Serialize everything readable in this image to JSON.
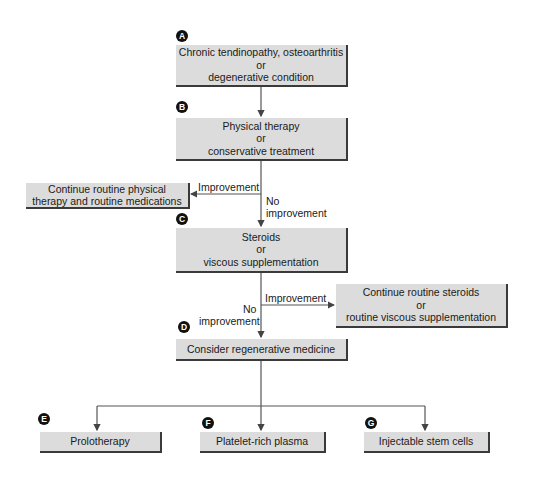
{
  "diagram": {
    "type": "flowchart",
    "nodes": [
      {
        "id": "A",
        "badge": "A",
        "lines": [
          "Chronic tendinopathy, osteoarthritis",
          "or",
          "degenerative condition"
        ]
      },
      {
        "id": "B",
        "badge": "B",
        "lines": [
          "Physical therapy",
          "or",
          "conservative treatment"
        ]
      },
      {
        "id": "B_alt",
        "lines": [
          "Continue routine physical",
          "therapy and routine medications"
        ]
      },
      {
        "id": "C",
        "badge": "C",
        "lines": [
          "Steroids",
          "or",
          "viscous supplementation"
        ]
      },
      {
        "id": "C_alt",
        "lines": [
          "Continue routine steroids",
          "or",
          "routine viscous supplementation"
        ]
      },
      {
        "id": "D",
        "badge": "D",
        "lines": [
          "Consider regenerative medicine"
        ]
      },
      {
        "id": "E",
        "badge": "E",
        "lines": [
          "Prolotherapy"
        ]
      },
      {
        "id": "F",
        "badge": "F",
        "lines": [
          "Platelet-rich plasma"
        ]
      },
      {
        "id": "G",
        "badge": "G",
        "lines": [
          "Injectable stem cells"
        ]
      }
    ],
    "edge_labels": {
      "b_improvement": "Improvement",
      "b_no_improvement": [
        "No",
        "improvement"
      ],
      "c_improvement": "Improvement",
      "c_no_improvement": [
        "No",
        "improvement"
      ]
    },
    "edges": [
      {
        "from": "A",
        "to": "B"
      },
      {
        "from": "B",
        "to": "B_alt",
        "label": "Improvement"
      },
      {
        "from": "B",
        "to": "C",
        "label": "No improvement"
      },
      {
        "from": "C",
        "to": "C_alt",
        "label": "Improvement"
      },
      {
        "from": "C",
        "to": "D",
        "label": "No improvement"
      },
      {
        "from": "D",
        "to": "E"
      },
      {
        "from": "D",
        "to": "F"
      },
      {
        "from": "D",
        "to": "G"
      }
    ]
  }
}
